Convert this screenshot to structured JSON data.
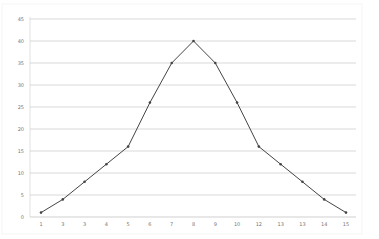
{
  "chart_data": {
    "type": "line",
    "title": "",
    "xlabel": "",
    "ylabel": "",
    "x": [
      1,
      2,
      3,
      4,
      5,
      6,
      7,
      8,
      9,
      10,
      11,
      12,
      13,
      14,
      15
    ],
    "x_tick_labels": [
      "1",
      "3",
      "3",
      "4",
      "5",
      "6",
      "7",
      "8",
      "9",
      "10",
      "12",
      "13",
      "13",
      "14",
      "15"
    ],
    "series": [
      {
        "name": "Series 1",
        "values": [
          1,
          4,
          8,
          12,
          16,
          26,
          35,
          40,
          35,
          26,
          16,
          12,
          8,
          4,
          1
        ],
        "color": "#444444",
        "marker": "dot"
      }
    ],
    "ylim": [
      0,
      45
    ],
    "y_ticks": [
      0,
      5,
      10,
      15,
      20,
      25,
      30,
      35,
      40,
      45
    ],
    "grid": {
      "horizontal": true,
      "vertical": false
    },
    "legend": "none"
  },
  "colors": {
    "line": "#444444",
    "grid": "#c8c8c8",
    "axis": "#bbbbbb",
    "label": "#777777"
  }
}
